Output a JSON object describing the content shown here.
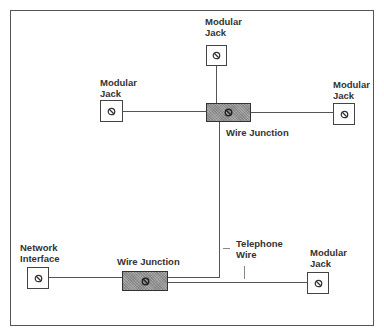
{
  "diagram": {
    "type": "telephone wiring layout",
    "nodes": {
      "top_jack": {
        "line1": "Modular",
        "line2": "Jack"
      },
      "left_jack": {
        "line1": "Modular",
        "line2": "Jack"
      },
      "right_jack": {
        "line1": "Modular",
        "line2": "Jack"
      },
      "lower_jack": {
        "line1": "Modular",
        "line2": "Jack"
      },
      "network_interface": {
        "line1": "Network",
        "line2": "Interface"
      },
      "upper_junction": {
        "label": "Wire Junction"
      },
      "lower_junction": {
        "label": "Wire Junction"
      }
    },
    "wire_label": {
      "line1": "Telephone",
      "line2": "Wire"
    },
    "colors": {
      "line": "#555555",
      "junction_fill": "#9a9a9a",
      "text": "#333333",
      "background": "#ffffff"
    },
    "symbol_icon": "prohibited-circle-icon"
  }
}
